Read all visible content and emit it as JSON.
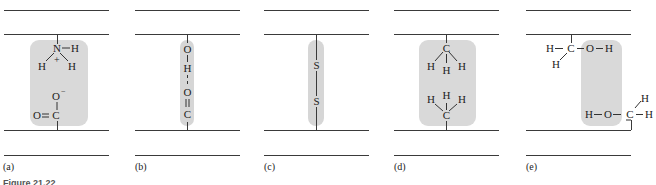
{
  "figure": {
    "caption": "Figure 21.22",
    "panels": [
      {
        "label": "(a)",
        "interaction": "salt bridge (ionic bond)",
        "top_group": {
          "center": "N",
          "charge": "+",
          "atoms": [
            "H",
            "H",
            "H"
          ]
        },
        "bottom_group": {
          "atoms": [
            "O",
            "O",
            "C"
          ],
          "charge": "−"
        }
      },
      {
        "label": "(b)",
        "interaction": "hydrogen bond",
        "chain": [
          "O",
          "H",
          "O",
          "C"
        ]
      },
      {
        "label": "(c)",
        "interaction": "disulfide bond",
        "chain": [
          "S",
          "S"
        ]
      },
      {
        "label": "(d)",
        "interaction": "hydrophobic interaction",
        "top_group": {
          "center": "C",
          "atoms": [
            "H",
            "H",
            "H"
          ]
        },
        "bottom_group": {
          "center": "C",
          "atoms": [
            "H",
            "H",
            "H"
          ]
        }
      },
      {
        "label": "(e)",
        "interaction": "hydrogen bond between hydroxyl groups",
        "top_group": [
          "H",
          "C",
          "O",
          "H",
          "H"
        ],
        "bottom_group": [
          "H",
          "O",
          "C",
          "H",
          "H"
        ]
      }
    ]
  },
  "text": {
    "a_label": "(a)",
    "b_label": "(b)",
    "c_label": "(c)",
    "d_label": "(d)",
    "e_label": "(e)",
    "N": "N",
    "H": "H",
    "O": "O",
    "C": "C",
    "S": "S",
    "plus": "+",
    "minus": "−",
    "caption": "Figure 21.22"
  }
}
